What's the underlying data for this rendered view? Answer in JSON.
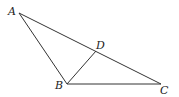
{
  "diagram": {
    "type": "triangle",
    "points": {
      "A": {
        "label": "A",
        "x": 19,
        "y": 13
      },
      "B": {
        "label": "B",
        "x": 67,
        "y": 84
      },
      "C": {
        "label": "C",
        "x": 161,
        "y": 84
      },
      "D": {
        "label": "D",
        "x": 96,
        "y": 51
      }
    },
    "segments": [
      "AB",
      "AC",
      "BC",
      "BD"
    ],
    "stroke_color": "#333333"
  }
}
